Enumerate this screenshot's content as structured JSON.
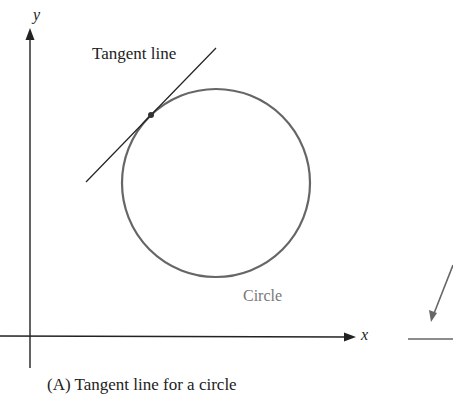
{
  "diagram": {
    "title": "Tangent line for a circle",
    "axes": {
      "x_label": "x",
      "y_label": "y"
    },
    "labels": {
      "tangent_line": "Tangent line",
      "circle": "Circle"
    },
    "caption": "(A)  Tangent line for a circle",
    "colors": {
      "axis": "#222222",
      "circle": "#666666",
      "tangent": "#222222",
      "circle_label": "#777777"
    },
    "geometry": {
      "circle": {
        "cx": 216,
        "cy": 183,
        "r": 94
      },
      "tangent_point": {
        "x": 151,
        "y": 114
      },
      "tangent_line": {
        "x1": 86,
        "y1": 182,
        "x2": 216,
        "y2": 48
      }
    }
  }
}
